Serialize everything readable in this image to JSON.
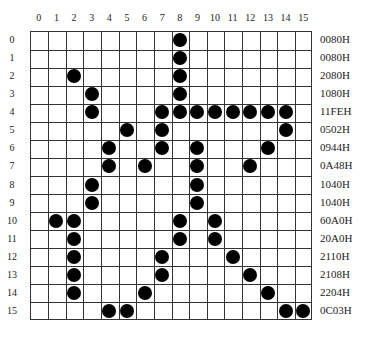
{
  "grid": {
    "cols": 16,
    "rows": 16,
    "col_labels": [
      "0",
      "1",
      "2",
      "3",
      "4",
      "5",
      "6",
      "7",
      "8",
      "9",
      "10",
      "11",
      "12",
      "13",
      "14",
      "15"
    ],
    "row_labels": [
      "0",
      "1",
      "2",
      "3",
      "4",
      "5",
      "6",
      "7",
      "8",
      "9",
      "10",
      "11",
      "12",
      "13",
      "14",
      "15"
    ],
    "hex_values": [
      "0080H",
      "0080H",
      "2080H",
      "1080H",
      "11FEH",
      "0502H",
      "0944H",
      "0A48H",
      "1040H",
      "1040H",
      "60A0H",
      "20A0H",
      "2110H",
      "2108H",
      "2204H",
      "0C03H"
    ],
    "filled": [
      [
        8
      ],
      [
        8
      ],
      [
        2,
        8
      ],
      [
        3,
        8
      ],
      [
        3,
        7,
        8,
        9,
        10,
        11,
        12,
        13,
        14
      ],
      [
        5,
        7,
        14
      ],
      [
        4,
        7,
        9,
        13
      ],
      [
        4,
        6,
        9,
        12
      ],
      [
        3,
        9
      ],
      [
        3,
        9
      ],
      [
        1,
        2,
        8,
        10
      ],
      [
        2,
        8,
        10
      ],
      [
        2,
        7,
        11
      ],
      [
        2,
        7,
        12
      ],
      [
        2,
        6,
        13
      ],
      [
        4,
        5,
        14,
        15
      ]
    ],
    "dot_color": "#000000",
    "line_color": "#333333"
  }
}
